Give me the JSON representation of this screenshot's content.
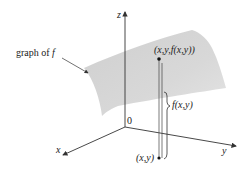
{
  "diagram": {
    "axes": {
      "z_label": "z",
      "x_label": "x",
      "y_label": "y",
      "origin_label": "0"
    },
    "surface_label": {
      "prefix": "graph of ",
      "func": "f"
    },
    "point_on_surface": "(x,y,f(x,y))",
    "point_in_plane": "(x,y)",
    "height_label": "f(x,y)",
    "colors": {
      "surface": "#d4d4d4",
      "axes": "#333333",
      "text": "#222222"
    }
  }
}
